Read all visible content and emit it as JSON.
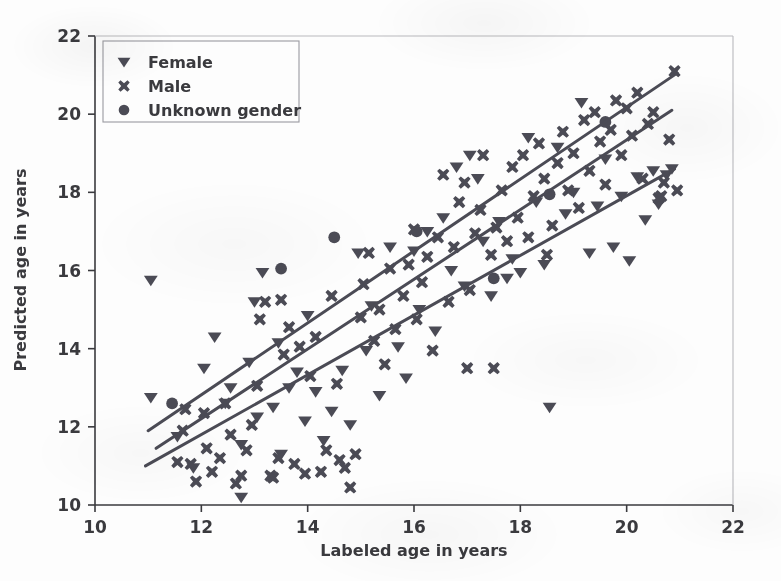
{
  "chart_data": {
    "type": "scatter",
    "title": "",
    "xlabel": "Labeled age in years",
    "ylabel": "Predicted age in years",
    "xlim": [
      10,
      22
    ],
    "ylim": [
      10,
      22
    ],
    "xticks": [
      10,
      12,
      14,
      16,
      18,
      20,
      22
    ],
    "yticks": [
      10,
      12,
      14,
      16,
      18,
      20,
      22
    ],
    "grid": false,
    "legend_position": "upper left",
    "marker_color": "#4b4b55",
    "line_color": "#4b4b55",
    "axis_color": "#3a3a3e",
    "background": "#fdfdfd",
    "series": [
      {
        "name": "Female",
        "marker": "triangle-down",
        "points": [
          [
            11.05,
            15.75
          ],
          [
            11.05,
            12.75
          ],
          [
            11.55,
            11.75
          ],
          [
            11.85,
            10.95
          ],
          [
            12.05,
            13.5
          ],
          [
            12.25,
            14.3
          ],
          [
            12.45,
            12.6
          ],
          [
            12.55,
            13.0
          ],
          [
            12.75,
            10.2
          ],
          [
            12.75,
            11.55
          ],
          [
            12.9,
            13.65
          ],
          [
            13.0,
            15.2
          ],
          [
            13.05,
            12.25
          ],
          [
            13.15,
            15.95
          ],
          [
            13.35,
            12.5
          ],
          [
            13.45,
            14.15
          ],
          [
            13.5,
            11.3
          ],
          [
            13.65,
            13.0
          ],
          [
            13.8,
            13.4
          ],
          [
            13.95,
            12.15
          ],
          [
            14.0,
            14.85
          ],
          [
            14.15,
            12.9
          ],
          [
            14.3,
            11.65
          ],
          [
            14.45,
            12.4
          ],
          [
            14.65,
            13.45
          ],
          [
            14.8,
            12.05
          ],
          [
            14.95,
            16.45
          ],
          [
            15.1,
            13.95
          ],
          [
            15.2,
            15.1
          ],
          [
            15.35,
            12.8
          ],
          [
            15.55,
            16.6
          ],
          [
            15.7,
            14.05
          ],
          [
            15.85,
            13.25
          ],
          [
            16.0,
            16.5
          ],
          [
            16.1,
            15.0
          ],
          [
            16.25,
            17.0
          ],
          [
            16.4,
            14.45
          ],
          [
            16.55,
            17.35
          ],
          [
            16.7,
            16.0
          ],
          [
            16.8,
            18.65
          ],
          [
            16.95,
            15.6
          ],
          [
            17.05,
            18.95
          ],
          [
            17.2,
            18.35
          ],
          [
            17.3,
            16.75
          ],
          [
            17.45,
            15.35
          ],
          [
            17.6,
            17.25
          ],
          [
            17.75,
            15.8
          ],
          [
            17.85,
            16.3
          ],
          [
            18.0,
            15.95
          ],
          [
            18.15,
            19.4
          ],
          [
            18.3,
            17.75
          ],
          [
            18.45,
            16.15
          ],
          [
            18.55,
            12.5
          ],
          [
            18.7,
            19.15
          ],
          [
            18.85,
            17.45
          ],
          [
            19.0,
            18.0
          ],
          [
            19.15,
            20.3
          ],
          [
            19.3,
            16.45
          ],
          [
            19.45,
            17.65
          ],
          [
            19.6,
            18.85
          ],
          [
            19.75,
            16.6
          ],
          [
            19.9,
            17.9
          ],
          [
            20.05,
            16.25
          ],
          [
            20.2,
            18.4
          ],
          [
            20.35,
            17.3
          ],
          [
            20.5,
            18.55
          ],
          [
            20.6,
            17.7
          ],
          [
            20.75,
            18.45
          ],
          [
            20.85,
            18.6
          ]
        ]
      },
      {
        "name": "Male",
        "marker": "x-thick",
        "points": [
          [
            11.55,
            11.1
          ],
          [
            11.65,
            11.9
          ],
          [
            11.7,
            12.45
          ],
          [
            11.8,
            11.05
          ],
          [
            11.9,
            10.6
          ],
          [
            12.05,
            12.35
          ],
          [
            12.1,
            11.45
          ],
          [
            12.2,
            10.85
          ],
          [
            12.35,
            11.2
          ],
          [
            12.45,
            12.6
          ],
          [
            12.55,
            11.8
          ],
          [
            12.65,
            10.55
          ],
          [
            12.75,
            10.75
          ],
          [
            12.85,
            11.4
          ],
          [
            12.95,
            12.05
          ],
          [
            13.05,
            13.05
          ],
          [
            13.1,
            14.75
          ],
          [
            13.2,
            15.2
          ],
          [
            13.3,
            10.75
          ],
          [
            13.35,
            10.7
          ],
          [
            13.45,
            11.2
          ],
          [
            13.5,
            15.25
          ],
          [
            13.55,
            13.85
          ],
          [
            13.65,
            14.55
          ],
          [
            13.75,
            11.05
          ],
          [
            13.85,
            14.05
          ],
          [
            13.95,
            10.8
          ],
          [
            14.05,
            13.3
          ],
          [
            14.15,
            14.3
          ],
          [
            14.25,
            10.85
          ],
          [
            14.35,
            11.4
          ],
          [
            14.45,
            15.35
          ],
          [
            14.55,
            13.1
          ],
          [
            14.6,
            11.15
          ],
          [
            14.7,
            10.95
          ],
          [
            14.8,
            10.45
          ],
          [
            14.9,
            11.3
          ],
          [
            15.0,
            14.8
          ],
          [
            15.05,
            15.65
          ],
          [
            15.15,
            16.45
          ],
          [
            15.25,
            14.2
          ],
          [
            15.35,
            15.0
          ],
          [
            15.45,
            13.6
          ],
          [
            15.55,
            16.05
          ],
          [
            15.65,
            14.5
          ],
          [
            15.8,
            15.35
          ],
          [
            15.9,
            16.15
          ],
          [
            16.0,
            17.05
          ],
          [
            16.05,
            14.75
          ],
          [
            16.15,
            15.7
          ],
          [
            16.25,
            16.35
          ],
          [
            16.35,
            13.95
          ],
          [
            16.45,
            16.85
          ],
          [
            16.55,
            18.45
          ],
          [
            16.65,
            15.2
          ],
          [
            16.75,
            16.6
          ],
          [
            16.85,
            17.75
          ],
          [
            16.95,
            18.25
          ],
          [
            17.0,
            13.5
          ],
          [
            17.05,
            15.5
          ],
          [
            17.15,
            16.95
          ],
          [
            17.25,
            17.55
          ],
          [
            17.3,
            18.95
          ],
          [
            17.45,
            16.4
          ],
          [
            17.5,
            13.5
          ],
          [
            17.55,
            17.1
          ],
          [
            17.65,
            18.05
          ],
          [
            17.75,
            16.75
          ],
          [
            17.85,
            18.65
          ],
          [
            17.95,
            17.35
          ],
          [
            18.05,
            18.95
          ],
          [
            18.15,
            16.85
          ],
          [
            18.25,
            17.9
          ],
          [
            18.35,
            19.25
          ],
          [
            18.45,
            18.35
          ],
          [
            18.5,
            16.4
          ],
          [
            18.6,
            17.15
          ],
          [
            18.7,
            18.75
          ],
          [
            18.8,
            19.55
          ],
          [
            18.9,
            18.05
          ],
          [
            19.0,
            19.0
          ],
          [
            19.1,
            17.6
          ],
          [
            19.2,
            19.85
          ],
          [
            19.3,
            18.55
          ],
          [
            19.4,
            20.05
          ],
          [
            19.5,
            19.3
          ],
          [
            19.6,
            18.2
          ],
          [
            19.7,
            19.6
          ],
          [
            19.8,
            20.35
          ],
          [
            19.9,
            18.95
          ],
          [
            20.0,
            20.15
          ],
          [
            20.1,
            19.45
          ],
          [
            20.2,
            20.55
          ],
          [
            20.3,
            18.35
          ],
          [
            20.4,
            19.75
          ],
          [
            20.5,
            20.05
          ],
          [
            20.6,
            17.85
          ],
          [
            20.65,
            17.9
          ],
          [
            20.7,
            18.25
          ],
          [
            20.8,
            19.35
          ],
          [
            20.9,
            21.1
          ],
          [
            20.95,
            18.05
          ]
        ]
      },
      {
        "name": "Unknown gender",
        "marker": "circle",
        "points": [
          [
            11.45,
            12.6
          ],
          [
            13.5,
            16.05
          ],
          [
            14.5,
            16.85
          ],
          [
            16.05,
            17.0
          ],
          [
            17.5,
            15.8
          ],
          [
            18.55,
            17.95
          ],
          [
            19.6,
            19.8
          ]
        ]
      }
    ],
    "trend_lines": [
      {
        "name": "upper-line",
        "x0": 11.0,
        "y0": 11.9,
        "x1": 20.95,
        "y1": 21.05
      },
      {
        "name": "middle-line",
        "x0": 11.15,
        "y0": 11.45,
        "x1": 20.85,
        "y1": 20.1
      },
      {
        "name": "lower-line",
        "x0": 10.95,
        "y0": 11.0,
        "x1": 20.9,
        "y1": 18.6
      }
    ]
  },
  "legend": {
    "items": [
      {
        "label": "Female",
        "marker": "triangle-down"
      },
      {
        "label": "Male",
        "marker": "x-thick"
      },
      {
        "label": "Unknown gender",
        "marker": "circle"
      }
    ]
  }
}
